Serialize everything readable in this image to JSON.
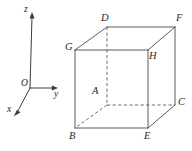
{
  "figure": {
    "width": 192,
    "height": 151,
    "background_color": "#ffffff",
    "line_color": "#4a4a4a",
    "hidden_line_color": "#5a5a5a",
    "label_color": "#2b2b2b"
  },
  "axes": {
    "origin_label": "O",
    "x_label": "x",
    "y_label": "y",
    "z_label": "z",
    "origin_point": {
      "x": 30,
      "y": 88
    },
    "x_tip": {
      "x": 14,
      "y": 115
    },
    "y_tip": {
      "x": 57,
      "y": 88
    },
    "z_tip": {
      "x": 32,
      "y": 13
    }
  },
  "cube": {
    "vertices": [
      {
        "name": "A",
        "label": "A",
        "x": 107,
        "y": 105,
        "hidden": true,
        "label_x": 92,
        "label_y": 86
      },
      {
        "name": "B",
        "label": "B",
        "x": 75,
        "y": 128,
        "hidden": false,
        "label_x": 69,
        "label_y": 131
      },
      {
        "name": "C",
        "label": "C",
        "x": 175,
        "y": 105,
        "hidden": false,
        "label_x": 178,
        "label_y": 97
      },
      {
        "name": "D",
        "label": "D",
        "x": 107,
        "y": 27,
        "hidden": false,
        "label_x": 101,
        "label_y": 13
      },
      {
        "name": "E",
        "label": "E",
        "x": 148,
        "y": 128,
        "hidden": false,
        "label_x": 144,
        "label_y": 131
      },
      {
        "name": "F",
        "label": "F",
        "x": 175,
        "y": 27,
        "hidden": false,
        "label_x": 176,
        "label_y": 13
      },
      {
        "name": "G",
        "label": "G",
        "x": 75,
        "y": 50,
        "hidden": false,
        "label_x": 65,
        "label_y": 42
      },
      {
        "name": "H",
        "label": "H",
        "x": 148,
        "y": 50,
        "hidden": false,
        "label_x": 149,
        "label_y": 51
      }
    ],
    "solid_edges": [
      {
        "from": "G",
        "to": "H"
      },
      {
        "from": "G",
        "to": "B"
      },
      {
        "from": "H",
        "to": "E"
      },
      {
        "from": "B",
        "to": "E"
      },
      {
        "from": "D",
        "to": "F"
      },
      {
        "from": "D",
        "to": "G"
      },
      {
        "from": "F",
        "to": "H"
      },
      {
        "from": "F",
        "to": "C"
      },
      {
        "from": "C",
        "to": "E"
      }
    ],
    "hidden_edges": [
      {
        "from": "D",
        "to": "A"
      },
      {
        "from": "A",
        "to": "C"
      },
      {
        "from": "A",
        "to": "B"
      }
    ]
  }
}
